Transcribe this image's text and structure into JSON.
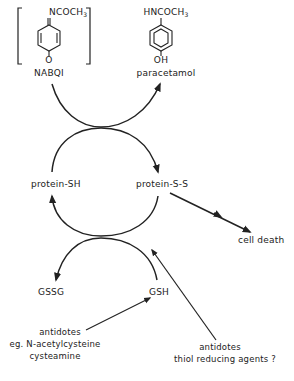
{
  "diagram": {
    "molecules": {
      "nabqi": {
        "substituent": "NCOCH",
        "subscript": "3",
        "bottom_atom": "O",
        "label": "NABQI"
      },
      "paracetamol": {
        "substituent": "HNCOCH",
        "subscript": "3",
        "bottom_atom": "OH",
        "label": "paracetamol"
      }
    },
    "nodes": {
      "protein_sh": "protein-SH",
      "protein_ss": "protein-S-S",
      "cell_death": "cell death",
      "gssg": "GSSG",
      "gsh": "GSH"
    },
    "antidotes_left": {
      "line1": "antidotes",
      "line2": "eg. N-acetylcysteine",
      "line3": "cysteamine"
    },
    "antidotes_right": {
      "line1": "antidotes",
      "line2": "thiol reducing agents ?"
    },
    "colors": {
      "ink": "#222222",
      "background": "#ffffff"
    }
  }
}
